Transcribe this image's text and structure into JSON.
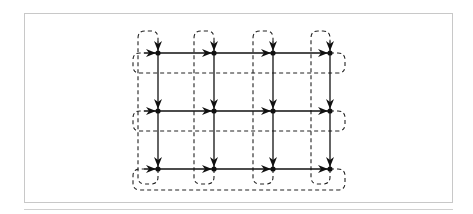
{
  "diagram": {
    "type": "2D torus interconnect (4x3 mesh with wrap-around links)",
    "columns": 4,
    "rows": 3,
    "node_x": [
      158,
      214,
      273,
      330
    ],
    "node_y": [
      53,
      111,
      169
    ],
    "wrap_column_x": [
      138,
      194,
      253,
      311
    ],
    "wrap_row_y": [
      73,
      131,
      190
    ],
    "top_loop_y": 31,
    "left_loop_x": 133,
    "right_loop_x": 345,
    "colors": {
      "line": "#111111",
      "frame": "#c8c8c8",
      "background": "#ffffff"
    }
  }
}
